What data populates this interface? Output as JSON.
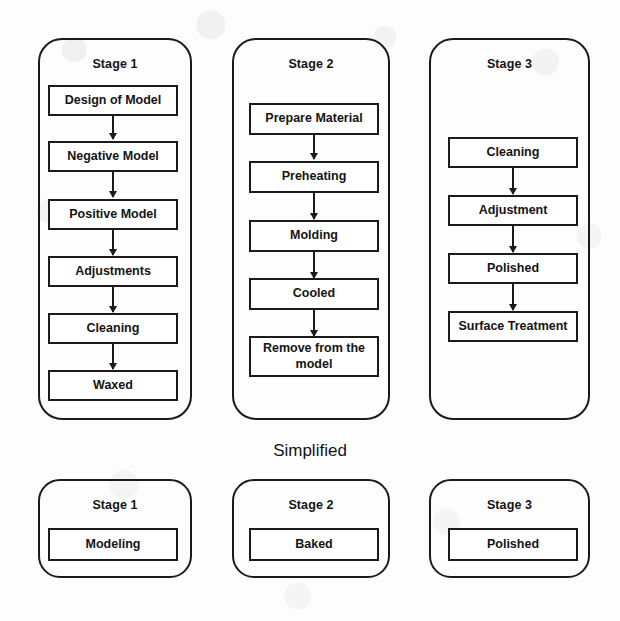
{
  "diagram": {
    "title_detailed": "",
    "section_label": "Simplified",
    "colors": {
      "stroke": "#1b1b1b",
      "text": "#141414",
      "background": "#fdfdfd",
      "box_fill": "#ffffff"
    },
    "detailed_stages": [
      {
        "title": "Stage 1",
        "steps": [
          "Design of  Model",
          "Negative Model",
          "Positive Model",
          "Adjustments",
          "Cleaning",
          "Waxed"
        ]
      },
      {
        "title": "Stage 2",
        "steps": [
          "Prepare Material",
          "Preheating",
          "Molding",
          "Cooled",
          "Remove from the model"
        ]
      },
      {
        "title": "Stage 3",
        "steps": [
          "Cleaning",
          "Adjustment",
          "Polished",
          "Surface Treatment"
        ]
      }
    ],
    "simplified_stages": [
      {
        "title": "Stage 1",
        "step": "Modeling"
      },
      {
        "title": "Stage 2",
        "step": "Baked"
      },
      {
        "title": "Stage 3",
        "step": "Polished"
      }
    ]
  }
}
